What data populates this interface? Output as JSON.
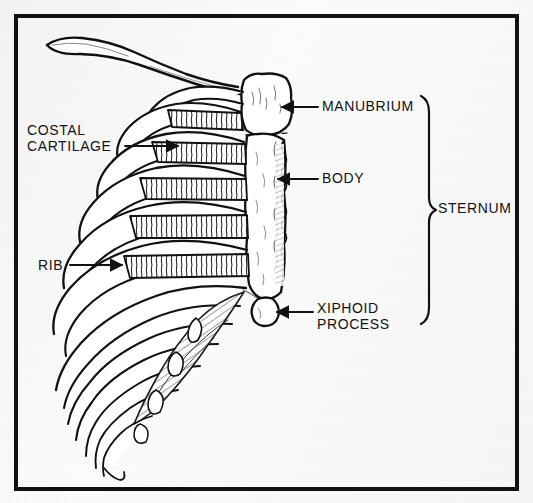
{
  "figure": {
    "type": "anatomical-illustration",
    "style": "black-and-white line drawing with hatched shading on a scanned page",
    "background_color": "#f7f7f7",
    "ink_color": "#111111",
    "frame": {
      "present": true,
      "color": "#111111",
      "thickness_px": 4
    }
  },
  "labels": {
    "costal_cartilage": {
      "line1": "COSTAL",
      "line2": "CARTILAGE",
      "side": "left",
      "leader": "line-with-arrowhead"
    },
    "rib": {
      "text": "RIB",
      "side": "left",
      "leader": "line-with-arrowhead"
    },
    "manubrium": {
      "text": "MANUBRIUM",
      "side": "right",
      "leader": "line-with-arrowhead"
    },
    "body": {
      "text": "BODY",
      "side": "right",
      "leader": "line-with-arrowhead"
    },
    "xiphoid_process": {
      "line1": "XIPHOID",
      "line2": "PROCESS",
      "side": "right",
      "leader": "line-with-arrowhead"
    },
    "sternum": {
      "text": "STERNUM",
      "side": "right",
      "leader": "curly-brace-spanning-manubrium-body-xiphoid"
    }
  },
  "anatomy_parts": [
    "clavicle",
    "ribs",
    "costal cartilages",
    "sternum: manubrium",
    "sternum: body",
    "sternum: xiphoid process"
  ]
}
